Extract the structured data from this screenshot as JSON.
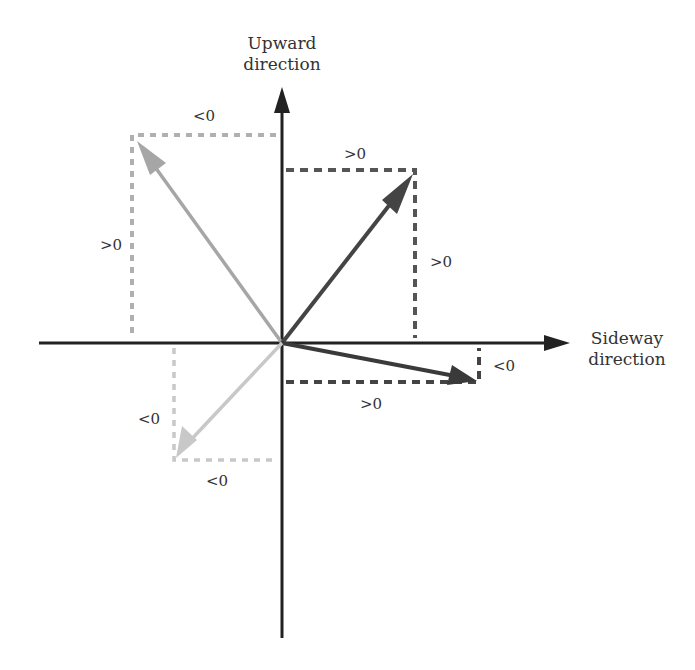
{
  "axes": {
    "vertical_title_line1": "Upward",
    "vertical_title_line2": "direction",
    "horizontal_title_line1": "Sideway",
    "horizontal_title_line2": "direction"
  },
  "labels": {
    "q2_top": "<0",
    "q2_left": ">0",
    "q1_top": ">0",
    "q1_right": ">0",
    "q4_right": "<0",
    "q4_bottom": ">0",
    "q3_left": "<0",
    "q3_bottom": "<0"
  },
  "colors": {
    "axis": "#222222",
    "vector_q1": "#444444",
    "vector_q2": "#a6a6a6",
    "vector_q3": "#c8c8c8",
    "vector_q4": "#3a3a3a"
  }
}
